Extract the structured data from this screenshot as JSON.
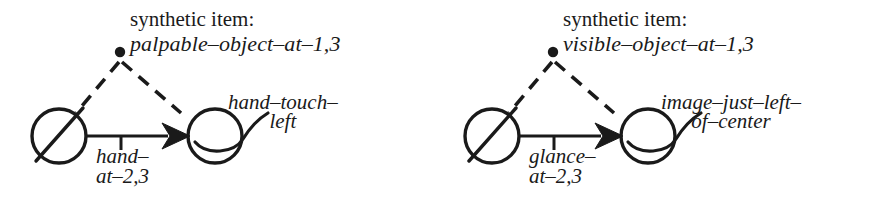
{
  "figure": {
    "type": "diagram",
    "background_color": "#ffffff",
    "stroke_color": "#1a1a1a",
    "panel_count": 2
  },
  "panels": [
    {
      "caption": "synthetic item:",
      "item_name": "palpable–object–at–1,3",
      "arrow_label_line1": "hand–",
      "arrow_label_line2": "at–2,3",
      "node_label_line1": "hand–touch–",
      "node_label_line2": "left"
    },
    {
      "caption": "synthetic item:",
      "item_name": "visible–object–at–1,3",
      "arrow_label_line1": "glance–",
      "arrow_label_line2": "at–2,3",
      "node_label_line1": "image–just–left–",
      "node_label_line2": "of–center"
    }
  ],
  "icons": {
    "bullet": "synthetic-item-dot",
    "source_node": "slashed-circle-node",
    "target_node": "circle-with-tail-node",
    "connector": "solid-arrow-with-tick",
    "link": "dashed-link"
  }
}
